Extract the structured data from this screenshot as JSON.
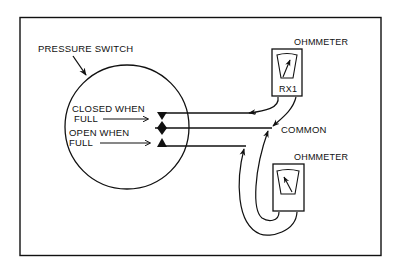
{
  "diagram": {
    "title_label": "PRESSURE SWITCH",
    "contacts": {
      "closed_when_full_line1": "CLOSED WHEN",
      "closed_when_full_line2": "FULL",
      "open_when_full_line1": "OPEN WHEN",
      "open_when_full_line2": "FULL"
    },
    "common_label": "COMMON",
    "ohmmeter_top": {
      "label": "OHMMETER",
      "range": "RX1"
    },
    "ohmmeter_bottom": {
      "label": "OHMMETER"
    },
    "colors": {
      "line": "#111111",
      "background": "#ffffff"
    }
  }
}
